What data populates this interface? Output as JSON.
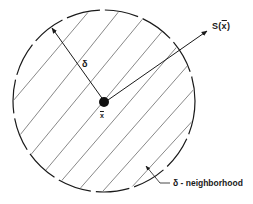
{
  "diagram": {
    "type": "neighborhood illustration",
    "circle": {
      "cx": 104,
      "cy": 101,
      "r": 91,
      "style": "dashed",
      "fill": "diagonal hatching"
    },
    "center_point": {
      "label": "x̄",
      "var": "x",
      "bar": "‾"
    },
    "radius_arrow": {
      "label": "δ"
    },
    "direction_arrow": {
      "label": "S(x̄)",
      "prefix": "S(",
      "var": "x",
      "suffix": ")"
    },
    "region_label": {
      "text": "δ - neighborhood"
    },
    "colors": {
      "ink": "#1a1a1a",
      "background": "#ffffff"
    }
  }
}
